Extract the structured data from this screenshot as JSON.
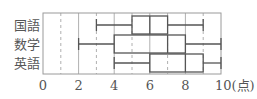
{
  "chart_data": {
    "type": "boxplot",
    "title": "",
    "xlabel": "",
    "ylabel": "",
    "x_unit": "(点)",
    "xlim": [
      0,
      10
    ],
    "x_ticks": [
      0,
      2,
      4,
      6,
      8,
      10
    ],
    "x_tick_labels": [
      "0",
      "2",
      "4",
      "6",
      "8",
      "10(点)"
    ],
    "grid": {
      "solid_at": [
        2,
        4,
        6,
        8
      ],
      "dashed_at": [
        1,
        3,
        5,
        7,
        9
      ]
    },
    "categories": [
      "国語",
      "数学",
      "英語"
    ],
    "series": [
      {
        "name": "国語",
        "min": 3,
        "q1": 5,
        "median": 6,
        "q3": 7,
        "max": 9
      },
      {
        "name": "数学",
        "min": 2,
        "q1": 4,
        "median": 7,
        "q3": 8,
        "max": 10
      },
      {
        "name": "英語",
        "min": 4,
        "q1": 6,
        "median": 8,
        "q3": 9,
        "max": 10
      }
    ],
    "colors": {
      "frame": "#9a9a9a",
      "grid": "#b0b0b0",
      "box": "#555555"
    }
  }
}
